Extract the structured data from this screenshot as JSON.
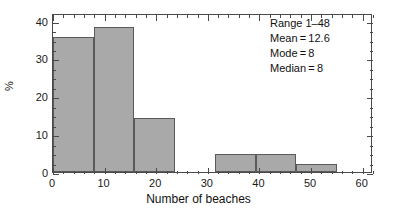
{
  "chart_data": {
    "type": "bar",
    "title": "",
    "xlabel": "Number of beaches",
    "ylabel": "%",
    "xlim": [
      0,
      62
    ],
    "ylim": [
      0,
      42
    ],
    "grid": false,
    "legend": null,
    "bin_width": 7.85,
    "bins": [
      {
        "x0": 0.0,
        "x1": 7.85,
        "value": 35.7
      },
      {
        "x0": 7.85,
        "x1": 15.7,
        "value": 38.2
      },
      {
        "x0": 15.7,
        "x1": 23.55,
        "value": 14.2
      },
      {
        "x0": 31.4,
        "x1": 39.25,
        "value": 4.7
      },
      {
        "x0": 39.25,
        "x1": 47.1,
        "value": 4.7
      },
      {
        "x0": 47.1,
        "x1": 54.95,
        "value": 2.2
      }
    ],
    "categories": [
      "0-7.85",
      "7.85-15.7",
      "15.7-23.55",
      "31.4-39.25",
      "39.25-47.1",
      "47.1-54.95"
    ],
    "values": [
      35.7,
      38.2,
      14.2,
      4.7,
      4.7,
      2.2
    ],
    "x_ticks": [
      0,
      10,
      20,
      30,
      40,
      50,
      60
    ],
    "x_tick_labels": [
      "0",
      "10",
      "20",
      "30",
      "40",
      "50",
      "60"
    ],
    "x_minor_step": 2,
    "y_ticks": [
      0,
      10,
      20,
      30,
      40
    ],
    "y_tick_labels": [
      "0",
      "10",
      "20",
      "30",
      "40"
    ],
    "y_minor_step": 2.5,
    "bar_color": "#a9a9a9",
    "bar_edge_color": "#5a5a5a",
    "axis_color": "#4a4a4a",
    "annotations": [
      "Range 1–48",
      "Mean = 12.6",
      "Mode = 8",
      "Median = 8"
    ],
    "stats": {
      "range_label": "Range",
      "range_value": "1–48",
      "mean_label": "Mean",
      "mean_value": "12.6",
      "mode_label": "Mode",
      "mode_value": "8",
      "median_label": "Median",
      "median_value": "8"
    }
  }
}
